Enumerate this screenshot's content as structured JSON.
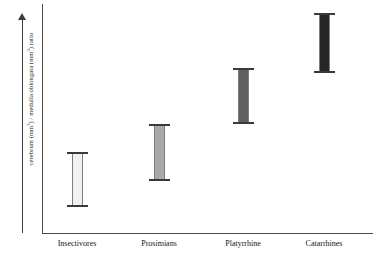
{
  "chart_data": {
    "type": "bar",
    "chart_subtype": "range-bar",
    "title": "",
    "xlabel": "",
    "ylabel": "cerebrum (mm³) / medulla oblongata (mm³) ratio",
    "ylabel_parts": {
      "prefix": "cerebrum (mm",
      "sup1": "3",
      "middle": ") / medulla oblongata (mm",
      "sup2": "3",
      "suffix": ") ratio"
    },
    "grid": false,
    "legend": "none",
    "axis_ticks": "none",
    "y_axis_style": "arrow",
    "categories": [
      "Insectivores",
      "Prosimians",
      "Platyrrhine",
      "Catarrhines"
    ],
    "series": [
      {
        "name": "range",
        "low": [
          11,
          23,
          44,
          64
        ],
        "high": [
          35,
          48,
          68,
          91
        ]
      }
    ],
    "ylim": [
      0,
      100
    ],
    "bars": [
      {
        "category": "Insectivores",
        "low": 11,
        "high": 35,
        "fill": "#f2f1ee",
        "center_x": 77,
        "top_px": 152,
        "bottom_px": 207
      },
      {
        "category": "Prosimians",
        "low": 23,
        "high": 48,
        "fill": "#a9a9a6",
        "center_x": 159,
        "top_px": 124,
        "bottom_px": 181
      },
      {
        "category": "Platyrrhine",
        "low": 44,
        "high": 68,
        "fill": "#606060",
        "center_x": 243,
        "top_px": 68,
        "bottom_px": 124
      },
      {
        "category": "Catarrhines",
        "low": 64,
        "high": 91,
        "fill": "#262626",
        "center_x": 324,
        "top_px": 13,
        "bottom_px": 73
      }
    ],
    "colors": {
      "axis": "#4a4a4a",
      "cap": "#3a3a3a",
      "stem_edge": "#7d7d7d",
      "text": "#141414",
      "background": "#ffffff"
    }
  }
}
